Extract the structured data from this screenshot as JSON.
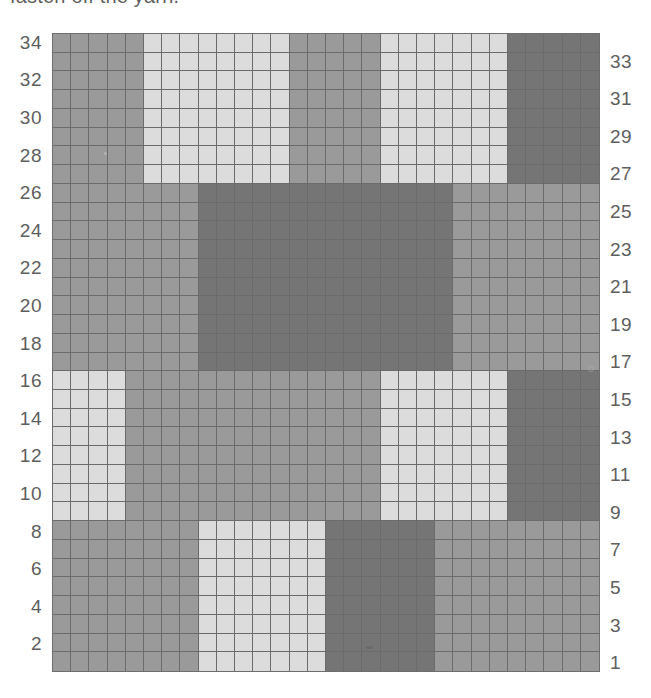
{
  "caption": {
    "text": "fasten off the yarn."
  },
  "chart_title": "Colorwork Grid Chart",
  "legend_colors": {
    "light": "#dcdcdc",
    "medium": "#9a9a9a",
    "dark": "#757575",
    "grid_line": "#6b6b6b",
    "label_text": "#5e5e5e",
    "background": "#ffffff"
  },
  "axis": {
    "left_labels": [
      34,
      32,
      30,
      28,
      26,
      24,
      22,
      20,
      18,
      16,
      14,
      12,
      10,
      8,
      6,
      4,
      2
    ],
    "right_labels": [
      33,
      31,
      29,
      27,
      25,
      23,
      21,
      19,
      17,
      15,
      13,
      11,
      9,
      7,
      5,
      3,
      1
    ],
    "left_label_side": "even-rows",
    "right_label_side": "odd-rows",
    "columns": 30,
    "rows": 34
  },
  "chart_data": {
    "type": "heatmap",
    "xlabel": "",
    "ylabel": "Row",
    "grid": true,
    "legend": "none",
    "columns": 30,
    "rows": 34,
    "row_order": "top_is_row_34",
    "palette": {
      "L": "#dcdcdc",
      "M": "#9a9a9a",
      "D": "#757575"
    },
    "palette_names": {
      "L": "light-grey-yarn",
      "M": "medium-grey-yarn",
      "D": "dark-grey-yarn"
    },
    "bands": [
      {
        "name": "top-band",
        "rows": [
          27,
          34
        ],
        "segments": [
          {
            "cols": [
              1,
              5
            ],
            "color": "M"
          },
          {
            "cols": [
              6,
              13
            ],
            "color": "L"
          },
          {
            "cols": [
              14,
              18
            ],
            "color": "M"
          },
          {
            "cols": [
              19,
              25
            ],
            "color": "L"
          },
          {
            "cols": [
              26,
              30
            ],
            "color": "D"
          }
        ]
      },
      {
        "name": "upper-middle-band",
        "rows": [
          17,
          26
        ],
        "segments": [
          {
            "cols": [
              1,
              8
            ],
            "color": "M"
          },
          {
            "cols": [
              9,
              22
            ],
            "color": "D"
          },
          {
            "cols": [
              23,
              30
            ],
            "color": "M"
          }
        ]
      },
      {
        "name": "lower-middle-band",
        "rows": [
          9,
          16
        ],
        "segments": [
          {
            "cols": [
              1,
              4
            ],
            "color": "L"
          },
          {
            "cols": [
              5,
              18
            ],
            "color": "M"
          },
          {
            "cols": [
              19,
              25
            ],
            "color": "L"
          },
          {
            "cols": [
              26,
              30
            ],
            "color": "D"
          }
        ]
      },
      {
        "name": "bottom-band",
        "rows": [
          1,
          8
        ],
        "segments": [
          {
            "cols": [
              1,
              8
            ],
            "color": "M"
          },
          {
            "cols": [
              9,
              15
            ],
            "color": "L"
          },
          {
            "cols": [
              16,
              21
            ],
            "color": "D"
          },
          {
            "cols": [
              22,
              30
            ],
            "color": "M"
          }
        ]
      }
    ],
    "rows_top_to_bottom": [
      "MMMMMLLLLLLLLMMMMMLLLLLLLDDDDD",
      "MMMMMLLLLLLLLMMMMMLLLLLLLDDDDD",
      "MMMMMLLLLLLLLMMMMMLLLLLLLDDDDD",
      "MMMMMLLLLLLLLMMMMMLLLLLLLDDDDD",
      "MMMMMLLLLLLLLMMMMMLLLLLLLDDDDD",
      "MMMMMLLLLLLLLMMMMMLLLLLLLDDDDD",
      "MMMMMLLLLLLLLMMMMMLLLLLLLDDDDD",
      "MMMMMLLLLLLLLMMMMMLLLLLLLDDDDD",
      "MMMMMMMMDDDDDDDDDDDDDDMMMMMMMM",
      "MMMMMMMMDDDDDDDDDDDDDDMMMMMMMM",
      "MMMMMMMMDDDDDDDDDDDDDDMMMMMMMM",
      "MMMMMMMMDDDDDDDDDDDDDDMMMMMMMM",
      "MMMMMMMMDDDDDDDDDDDDDDMMMMMMMM",
      "MMMMMMMMDDDDDDDDDDDDDDMMMMMMMM",
      "MMMMMMMMDDDDDDDDDDDDDDMMMMMMMM",
      "MMMMMMMMDDDDDDDDDDDDDDMMMMMMMM",
      "MMMMMMMMDDDDDDDDDDDDDDMMMMMMMM",
      "MMMMMMMMDDDDDDDDDDDDDDMMMMMMMM",
      "LLLLMMMMMMMMMMMMMMLLLLLLLDDDDD",
      "LLLLMMMMMMMMMMMMMMLLLLLLLDDDDD",
      "LLLLMMMMMMMMMMMMMMLLLLLLLDDDDD",
      "LLLLMMMMMMMMMMMMMMLLLLLLLDDDDD",
      "LLLLMMMMMMMMMMMMMMLLLLLLLDDDDD",
      "LLLLMMMMMMMMMMMMMMLLLLLLLDDDDD",
      "LLLLMMMMMMMMMMMMMMLLLLLLLDDDDD",
      "LLLLMMMMMMMMMMMMMMLLLLLLLDDDDD",
      "MMMMMMMMLLLLLLLDDDDDDMMMMMMMMM",
      "MMMMMMMMLLLLLLLDDDDDDMMMMMMMMM",
      "MMMMMMMMLLLLLLLDDDDDDMMMMMMMMM",
      "MMMMMMMMLLLLLLLDDDDDDMMMMMMMMM",
      "MMMMMMMMLLLLLLLDDDDDDMMMMMMMMM",
      "MMMMMMMMLLLLLLLDDDDDDMMMMMMMMM",
      "MMMMMMMMLLLLLLLDDDDDDMMMMMMMMM",
      "MMMMMMMMLLLLLLLDDDDDDMMMMMMMMM"
    ]
  }
}
